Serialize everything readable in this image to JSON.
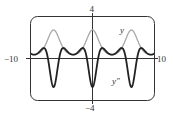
{
  "chart_data": {
    "type": "line",
    "title": "",
    "xlabel": "",
    "ylabel": "",
    "xlim": [
      -10,
      10
    ],
    "ylim": [
      -4,
      4
    ],
    "grid": false,
    "tick_labels": {
      "x_min": "−10",
      "x_max": "10",
      "y_max": "4",
      "y_min": "−4"
    },
    "series": [
      {
        "name": "y",
        "label": "y",
        "color": "#a8a8a8",
        "function": "e^(cos x)",
        "x": [
          -10,
          -9,
          -8,
          -7,
          -6.283,
          -6,
          -5,
          -4,
          -3.1416,
          -3,
          -2,
          -1,
          0,
          1,
          2,
          3,
          3.1416,
          4,
          5,
          6,
          6.283,
          7,
          8,
          9,
          10
        ],
        "values": [
          0.43,
          0.4,
          0.86,
          2.13,
          2.72,
          2.61,
          1.33,
          0.52,
          0.37,
          0.37,
          0.66,
          1.72,
          2.72,
          1.72,
          0.66,
          0.37,
          0.37,
          0.52,
          1.33,
          2.61,
          2.72,
          2.13,
          0.86,
          0.4,
          0.43
        ]
      },
      {
        "name": "y''",
        "label": "y″",
        "color": "#222222",
        "function": "e^(cos x)(sin^2 x - cos x)",
        "x": [
          -10,
          -9,
          -8,
          -7,
          -6.283,
          -6,
          -5,
          -4,
          -3.1416,
          -3,
          -2,
          -1,
          0,
          1,
          2,
          3,
          3.1416,
          4,
          5,
          6,
          6.283,
          7,
          8,
          9,
          10
        ],
        "values": [
          0.48,
          0.4,
          0.97,
          -0.82,
          -2.72,
          -2.32,
          0.85,
          0.64,
          0.37,
          0.37,
          0.82,
          0.29,
          -2.72,
          0.29,
          0.82,
          0.37,
          0.37,
          0.64,
          0.85,
          -2.32,
          -2.72,
          -0.82,
          0.97,
          0.4,
          0.48
        ]
      }
    ],
    "annotations": [
      {
        "text": "y",
        "near_series": "y"
      },
      {
        "text": "y″",
        "near_series": "y''"
      }
    ]
  }
}
